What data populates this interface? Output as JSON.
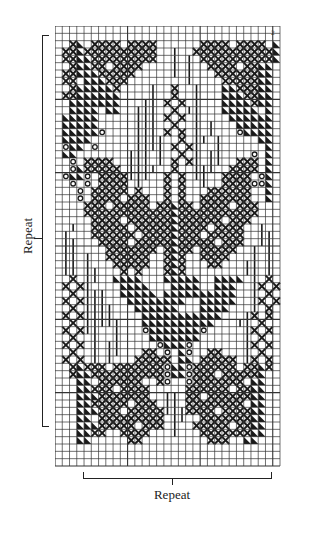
{
  "chart_data": {
    "type": "table",
    "title": "",
    "columns": 31,
    "rows": 60,
    "legend": {
      "X": "cross-stitch",
      "T": "black-triangle",
      "|": "vertical-line",
      "O": "circle",
      ".": "empty"
    },
    "grid": [
      "...............................",
      "...............................",
      "..XT.XXXX.XXXX......XXXX.XXXX.T",
      ".XXTXXXXXXXXXX..|..XXXXXXXXXXXT",
      ".XXTTXXXXXXXXX..|.|.XXXXXXXXXXT",
      "..XTTXX.XXXX....|.|..XXXX.XXTT.",
      ".XXTTTXXXXX.....|.|...XXXXXXTT.",
      ".XX.TTTXXX........|....XXXXXTT.",
      "..XTTTTTX....|..X..|...TTXXXTT.",
      ".XXTTTTTT....|..X..|...TTTXXTT.",
      "..TTTTTTT...||.X.X.|...TTTTXTT.",
      "..TTTT.TT..|||..X.||...TTTTT.T.",
      ".TTTTT.....|||.X.X.|....TTTTTT.",
      ".TTTTT.....|||..X..|.|...TTTTT.",
      ".TTTTTO....|||.X.X.|.|...OTTTT.",
      ".TTTT......||||..X.||.|.....TT.",
      ".OTT.O.....||||.X.X|..|......T.",
      ".TT.......|||.|..X.|.||....O.T.",
      "..O.XXXX..|||.|.X.X|.||..XXX.T.",
      "..OTXXXXX.||||..X..|||..XXXX.T.",
      ".OTTO.XXXX|||..X.X.||..XXXX.OT.",
      "..O.O.XXXX.|...X.X..|..XXXXOOT.",
      "...O.XXXXX.X...X.X...XXXXXX..T.",
      "...O.XXXX.XXX..X.X..XXXXXXX..T.",
      "....XXX.XXXXX.XXTXX.XXXX.XXX...",
      "....XXXXXXXXXXXXTXXXXXXXXXXX...",
      ".....XXXX.XXXXXXTXXXXXX.XXX....",
      "..|..XXXXX.XXXXXTXXXX.XXXX..|..",
      ".|...XXXXXX.XXXXTXXX.XXXXX..||.",
      ".||...XXXX.XXXXXTXXXXX.XXX..||.",
      ".||....XXXXXXX.XTXX.XXXXX..|.|.",
      ".||.|..XXXXXX..XTX..XXXX...|.|.",
      ".||.|...XXXXX..XTX...XX...||.|.",
      ".||.||...X.X...XTX........||.|.",
      "..X.||..TTTT...TTTTT..TTTT.|.X.",
      ".X.X|....TTTT...TTTT..TTT..|X.X",
      "..X.|||..TTTTT.TTTTTTTTTT..|.X.",
      ".X.X|||...TTTTTTTT..TTTTT..|X.X",
      "..X.||||...TTTTTT...TTTT...|.X.",
      ".X.X||||....TTTTTTTTTTT...|X.X.",
      "..X.|||||...TTTTTTTTTT...||.X..",
      ".X.X||..|...OTTTTTTTO.....|X.X.",
      "..X..|..|....TTTTTTT......|.X..",
      ".X.X.|.||.....OTTTO.......|X.X.",
      "..X..|.||...XX.O.TO..XX...|.X..",
      ".X.X.|.|...XXXXX.TT.XXXXX.|X.X.",
      "..XTXXX.XXXXXXXOTTOXXXXXX.XXTX.",
      "..XTTXXXXXXXXXXOTTOXXX.XXXXXT..",
      "...TT.XXXXXX..XO..OXXXXXXX.TT..",
      "...TTXXX.XXXX.....XXXXXX.XXTT..",
      "...TTTXXXXXXX..||.XX.XXXXXXTT..",
      "...TTXXXXX.XXX.||.XXXXXXXX.TT..",
      "...TTTXXX.XXXXX|||XXXX.XXXXTT..",
      "...TT.XXXXXXXXX.||..XXXXXXXTT..",
      "...TTTXXXXX.XXX.|..XXXXX.XXTT..",
      "...TTXX..XXXX...|...XXXXXXXTT..",
      "...TT.....XX.........XXX..TT...",
      "...............................",
      "...............................",
      "..............................."
    ]
  },
  "labels": {
    "left_repeat": "Repeat",
    "bottom_repeat": "Repeat",
    "corner_mark": "2"
  },
  "colors": {
    "ink": "#1a1a1a",
    "paper": "#ffffff",
    "gridline": "#333333"
  }
}
